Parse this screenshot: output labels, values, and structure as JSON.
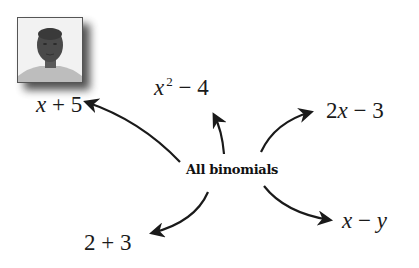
{
  "diagram": {
    "center": {
      "label": "All binomials"
    },
    "photo": {
      "alt": "portrait-photo"
    },
    "branches": [
      {
        "id": "x-plus-5",
        "parts": [
          "x",
          " + 5"
        ],
        "direction": "left"
      },
      {
        "id": "x-squared-minus-4",
        "parts": [
          "x",
          "2",
          " − 4"
        ],
        "direction": "up"
      },
      {
        "id": "2x-minus-3",
        "parts": [
          "2",
          "x",
          " − 3"
        ],
        "direction": "upper-right"
      },
      {
        "id": "2-plus-3",
        "parts": [
          "2 + 3"
        ],
        "direction": "lower-left"
      },
      {
        "id": "x-minus-y",
        "parts": [
          "x",
          " − ",
          "y"
        ],
        "direction": "lower-right"
      }
    ],
    "colors": {
      "background": "#ffffff",
      "text": "#111111",
      "arrow": "#1a1a1a"
    }
  }
}
